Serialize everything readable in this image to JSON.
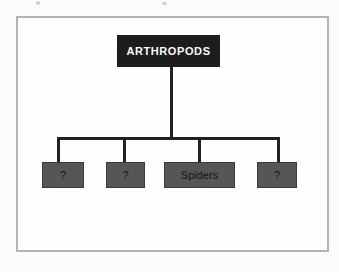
{
  "diagram": {
    "root": {
      "label": "ARTHROPODS"
    },
    "children": [
      {
        "label": "?"
      },
      {
        "label": "?"
      },
      {
        "label": "Spiders"
      },
      {
        "label": "?"
      }
    ],
    "colors": {
      "page_bg": "#fbfbfa",
      "canvas_bg": "#fefefe",
      "frame_border": "#b4b4b4",
      "root_box_bg": "#1d1d1d",
      "root_box_text": "#fafafa",
      "child_box_bg": "#565656",
      "child_box_border": "#3a3a3a",
      "child_box_text": "#151515",
      "connector": "#222222"
    }
  }
}
